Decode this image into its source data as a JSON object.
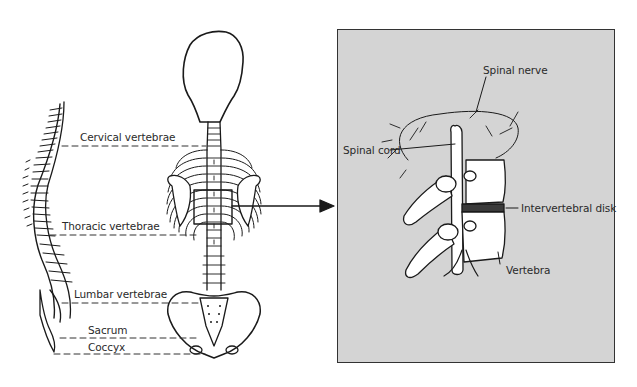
{
  "figure": {
    "type": "anatomical-diagram",
    "colors": {
      "line": "#1a1a1a",
      "inset_background": "#d4d4d4",
      "inset_border": "#333333",
      "bone_fill": "#ffffff",
      "disk_fill": "#3a3a3a"
    }
  },
  "spine_labels": [
    {
      "id": "cervical",
      "text": "Cervical vertebrae"
    },
    {
      "id": "thoracic",
      "text": "Thoracic vertebrae"
    },
    {
      "id": "lumbar",
      "text": "Lumbar vertebrae"
    },
    {
      "id": "sacrum",
      "text": "Sacrum"
    },
    {
      "id": "coccyx",
      "text": "Coccyx"
    }
  ],
  "inset": {
    "labels": [
      {
        "id": "spinal-nerve",
        "text": "Spinal nerve"
      },
      {
        "id": "spinal-cord",
        "text": "Spinal cord"
      },
      {
        "id": "intervertebral-disk",
        "text": "Intervertebral disk"
      },
      {
        "id": "vertebra",
        "text": "Vertebra"
      }
    ]
  },
  "callout": {
    "icon": "arrow-right-icon",
    "from": "thoracic-region-box",
    "to": "inset"
  }
}
